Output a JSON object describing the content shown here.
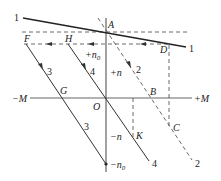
{
  "diagram": {
    "axes": {
      "neg_m": "−M",
      "pos_m": "+M",
      "origin": "O",
      "pos_n": "+n",
      "neg_n": "−n",
      "pos_n0": "+n",
      "pos_n0_sub": "0",
      "neg_n0": "−n",
      "neg_n0_sub": "0"
    },
    "points": {
      "A": "A",
      "B": "B",
      "C": "C",
      "D": "D",
      "F": "F",
      "G": "G",
      "H": "H",
      "K": "K"
    },
    "curves": {
      "curve1_left": "1",
      "curve1_right": "1",
      "curve2_mid": "2",
      "curve2_end": "2",
      "curve3_mid": "3",
      "curve3_low": "3",
      "curve4_mid": "4",
      "curve4_end": "4"
    },
    "colors": {
      "line": "#333333",
      "axis": "#555555",
      "background": "#ffffff"
    }
  }
}
